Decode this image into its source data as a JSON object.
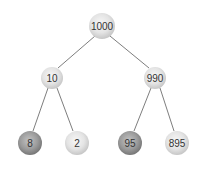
{
  "diagram": {
    "type": "binary-tree",
    "nodes": {
      "root": {
        "label": "1000",
        "shade": "light"
      },
      "left": {
        "label": "10",
        "shade": "light"
      },
      "right": {
        "label": "990",
        "shade": "light"
      },
      "left_left": {
        "label": "8",
        "shade": "dark"
      },
      "left_right": {
        "label": "2",
        "shade": "light"
      },
      "right_left": {
        "label": "95",
        "shade": "dark"
      },
      "right_right": {
        "label": "895",
        "shade": "light"
      }
    },
    "edges": [
      {
        "from": "1000",
        "to": "10"
      },
      {
        "from": "1000",
        "to": "990"
      },
      {
        "from": "10",
        "to": "8"
      },
      {
        "from": "10",
        "to": "2"
      },
      {
        "from": "990",
        "to": "95"
      },
      {
        "from": "990",
        "to": "895"
      }
    ],
    "colors": {
      "edge": "#6e6e6e",
      "light_node_center": "#f4f4f4",
      "light_node_edge": "#c4c4c4",
      "dark_node_center": "#b8b8b8",
      "dark_node_edge": "#7a7a7a",
      "label": "#333333"
    }
  }
}
